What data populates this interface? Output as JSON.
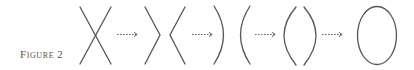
{
  "figure": {
    "label_first": "F",
    "label_rest": "IGURE",
    "label_number": "2",
    "label_full": "Figure 2"
  },
  "diagram": {
    "stages": [
      {
        "id": "crossing",
        "name": "two crossing lines (X)"
      },
      {
        "id": "separated-wedges",
        "name": "separated wedges ( > < )"
      },
      {
        "id": "outward-arcs",
        "name": "outward arcs ( ) ( )"
      },
      {
        "id": "inward-arcs",
        "name": "inward arcs ( ( ) )"
      },
      {
        "id": "closed-ellipse",
        "name": "closed ellipse"
      }
    ],
    "arrows": [
      {
        "from": "crossing",
        "to": "separated-wedges",
        "style": "dashed"
      },
      {
        "from": "separated-wedges",
        "to": "outward-arcs",
        "style": "dashed"
      },
      {
        "from": "outward-arcs",
        "to": "inward-arcs",
        "style": "dashed"
      },
      {
        "from": "inward-arcs",
        "to": "closed-ellipse",
        "style": "dashed"
      }
    ],
    "colors": {
      "stroke": "#555555",
      "arrow": "#666666",
      "background": "#ffffff"
    }
  }
}
